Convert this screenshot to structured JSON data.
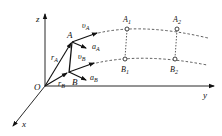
{
  "axes": {
    "z": "z",
    "y": "y",
    "x": "x",
    "origin": "O"
  },
  "points": {
    "A": "A",
    "B": "B",
    "A1": {
      "base": "A",
      "sub": "1"
    },
    "A2": {
      "base": "A",
      "sub": "2"
    },
    "B1": {
      "base": "B",
      "sub": "1"
    },
    "B2": {
      "base": "B",
      "sub": "2"
    }
  },
  "vectors": {
    "rA": {
      "base": "r",
      "sub": "A"
    },
    "rB": {
      "base": "r",
      "sub": "B"
    },
    "vA": {
      "base": "υ",
      "sub": "A"
    },
    "vB": {
      "base": "υ",
      "sub": "B"
    },
    "aA": {
      "base": "a",
      "sub": "A"
    },
    "aB": {
      "base": "a",
      "sub": "B"
    }
  }
}
